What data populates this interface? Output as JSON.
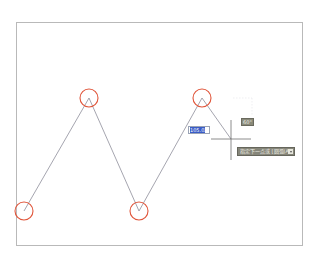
{
  "canvas": {
    "frame_color": "#b9b9b9",
    "background": "#ffffff"
  },
  "polyline": {
    "color": "#8e8e9a",
    "vertices": [
      {
        "x": 24,
        "y": 211
      },
      {
        "x": 89,
        "y": 98
      },
      {
        "x": 139,
        "y": 211
      },
      {
        "x": 202,
        "y": 98
      },
      {
        "x": 231,
        "y": 139
      }
    ]
  },
  "vertex_markers": {
    "color": "#e0553a",
    "radius": 9,
    "points": [
      {
        "x": 24,
        "y": 211
      },
      {
        "x": 89,
        "y": 98
      },
      {
        "x": 139,
        "y": 211
      },
      {
        "x": 202,
        "y": 98
      }
    ]
  },
  "cursor": {
    "type": "crosshair",
    "x": 231,
    "y": 139,
    "color": "#6e6e6e"
  },
  "dynamic_input": {
    "length_value": "105.02",
    "length_highlight_color": "#3a5cc6",
    "angle_value": "60°",
    "prompt_text": "指定下一点或 [圆弧(A)]",
    "prompt_dropdown_icon": "chevron-down-icon"
  }
}
